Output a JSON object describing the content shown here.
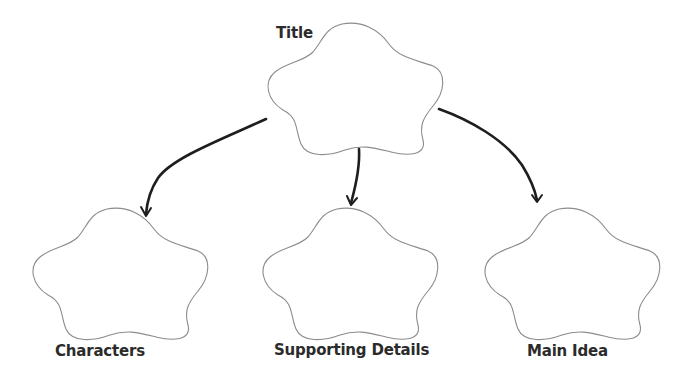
{
  "diagram": {
    "type": "graphic-organizer",
    "colors": {
      "background": "#ffffff",
      "shape_stroke": "#8c8c8c",
      "arrow": "#1e1e1e",
      "text": "#2b2b2b"
    },
    "nodes": [
      {
        "id": "title",
        "label": "Title",
        "shape": "flower",
        "level": 0
      },
      {
        "id": "characters",
        "label": "Characters",
        "shape": "flower",
        "level": 1
      },
      {
        "id": "supporting-details",
        "label": "Supporting Details",
        "shape": "flower",
        "level": 1
      },
      {
        "id": "main-idea",
        "label": "Main Idea",
        "shape": "flower",
        "level": 1
      }
    ],
    "edges": [
      {
        "from": "title",
        "to": "characters"
      },
      {
        "from": "title",
        "to": "supporting-details"
      },
      {
        "from": "title",
        "to": "main-idea"
      }
    ]
  }
}
